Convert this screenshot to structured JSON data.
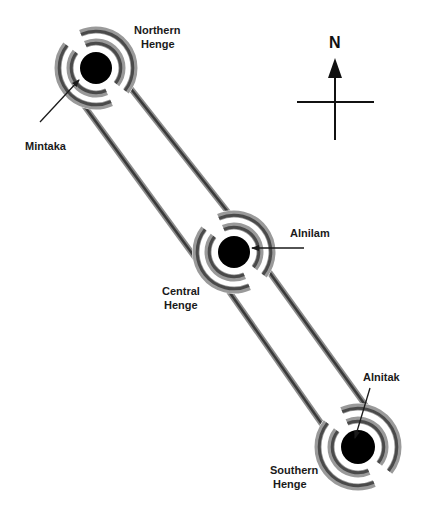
{
  "diagram": {
    "colors": {
      "rail_dark": "#3a3a3a",
      "rail_light": "#8c8c8c",
      "ring_dark": "#4a4a4a",
      "ring_light": "#9a9a9a",
      "star": "#000000",
      "ink": "#1a1a1a",
      "background": "#ffffff"
    },
    "compass": {
      "label": "N",
      "icon": "north-arrow-icon"
    },
    "henges": [
      {
        "id": "northern",
        "label_line1": "Northern",
        "label_line2": "Henge"
      },
      {
        "id": "central",
        "label_line1": "Central",
        "label_line2": "Henge"
      },
      {
        "id": "southern",
        "label_line1": "Southern",
        "label_line2": "Henge"
      }
    ],
    "stars": [
      {
        "id": "mintaka",
        "label": "Mintaka",
        "henge": "northern"
      },
      {
        "id": "alnilam",
        "label": "Alnilam",
        "henge": "central"
      },
      {
        "id": "alnitak",
        "label": "Alnitak",
        "henge": "southern"
      }
    ]
  }
}
